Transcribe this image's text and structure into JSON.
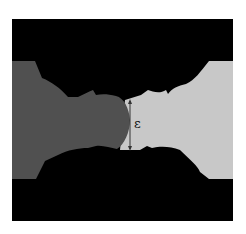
{
  "diagram": {
    "gap_label": "ε",
    "colors": {
      "background": "#000000",
      "left_body": "#505050",
      "right_body": "#c8c8c8",
      "arrow": "#333333",
      "page": "#ffffff"
    }
  }
}
